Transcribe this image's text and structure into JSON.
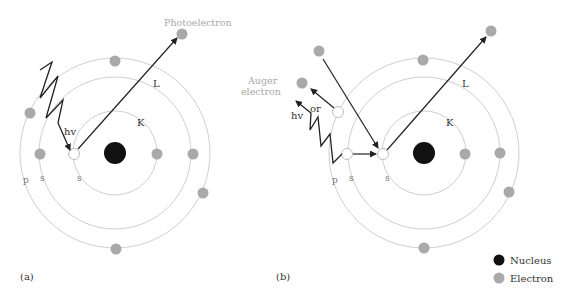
{
  "figure": {
    "panels": [
      {
        "id": "a",
        "label": "(a)",
        "photon_label": "hv",
        "photoelectron_label": "Photoelectron",
        "shell_labels": {
          "K": "K",
          "L": "L"
        },
        "subshell_labels": {
          "p": "p",
          "s_outer": "s",
          "s_inner": "s"
        }
      },
      {
        "id": "b",
        "label": "(b)",
        "photon_label": "hv",
        "or_label": "or",
        "auger_label_line1": "Auger",
        "auger_label_line2": "electron",
        "shell_labels": {
          "K": "K",
          "L": "L"
        },
        "subshell_labels": {
          "p": "p",
          "s_outer": "s",
          "s_inner": "s"
        }
      }
    ],
    "legend": {
      "items": [
        {
          "label": "Nucleus",
          "color": "#111111"
        },
        {
          "label": "Electron",
          "color": "#a9a9a9"
        }
      ]
    }
  },
  "colors": {
    "nucleus": "#111111",
    "electron": "#a9a9a9",
    "orbit": "#cfcfcf",
    "arrow": "#222222",
    "muted_text": "#a8a8a8"
  }
}
